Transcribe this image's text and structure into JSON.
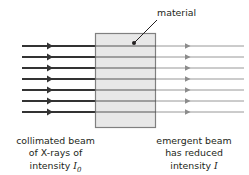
{
  "figure": {
    "background_color": "#ffffff",
    "ink_color": "#231f20"
  },
  "material": {
    "label": "material",
    "fill_color": "#e8e8e8",
    "stroke_color": "#808080",
    "x": 95,
    "y": 33,
    "width": 61,
    "height": 95
  },
  "leader": {
    "name": "material-leader-line",
    "from_x": 157,
    "from_y": 20,
    "to_x": 134,
    "to_y": 43,
    "dot_radius": 2
  },
  "beams": {
    "count": 7,
    "y_positions": [
      46,
      57,
      68,
      79,
      90,
      101,
      112
    ],
    "incident": {
      "color": "#333333",
      "stroke_width": 2.2,
      "start_x": 22,
      "end_x": 95,
      "arrow_x": 51
    },
    "emergent": {
      "color": "#8c8c8c",
      "stroke_width": 0.9,
      "start_x": 156,
      "end_x": 244,
      "arrow_x": 189
    }
  },
  "captions": {
    "left": {
      "name": "collimated-beam-caption",
      "line1": "collimated beam",
      "line2": "of X-rays of",
      "line3_prefix": "intensity ",
      "line3_symbol": "I",
      "line3_subscript": "0"
    },
    "right": {
      "name": "emergent-beam-caption",
      "line1": "emergent beam",
      "line2": "has reduced",
      "line3_prefix": "intensity ",
      "line3_symbol": "I",
      "line3_subscript": ""
    }
  }
}
